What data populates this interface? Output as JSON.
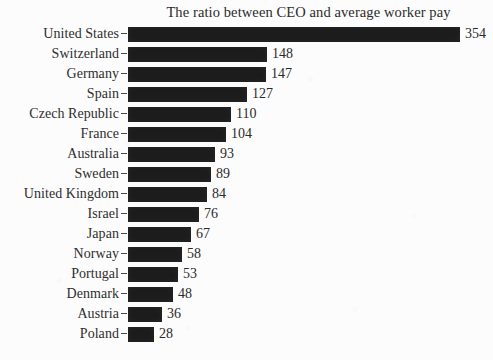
{
  "chart_data": {
    "type": "bar",
    "orientation": "horizontal",
    "title": "The ratio between CEO and average worker pay",
    "xlabel": "",
    "ylabel": "",
    "grid": false,
    "legend": null,
    "xlim": [
      0,
      354
    ],
    "categories": [
      "United States",
      "Switzerland",
      "Germany",
      "Spain",
      "Czech Republic",
      "France",
      "Australia",
      "Sweden",
      "United Kingdom",
      "Israel",
      "Japan",
      "Norway",
      "Portugal",
      "Denmark",
      "Austria",
      "Poland"
    ],
    "values": [
      354,
      148,
      147,
      127,
      110,
      104,
      93,
      89,
      84,
      76,
      67,
      58,
      53,
      48,
      36,
      28
    ],
    "value_labels": [
      "354",
      "148",
      "147",
      "127",
      "110",
      "104",
      "93",
      "89",
      "84",
      "76",
      "67",
      "58",
      "53",
      "48",
      "36",
      "28"
    ],
    "bar_color": "#1c1c1c",
    "background_color": "#fcfcfc",
    "text_color": "#2b2b2b"
  },
  "layout": {
    "bar_origin_px": 128,
    "px_per_unit": 0.938,
    "row_pitch_px": 20,
    "bar_height_px": 15,
    "value_gap_px": 5
  }
}
